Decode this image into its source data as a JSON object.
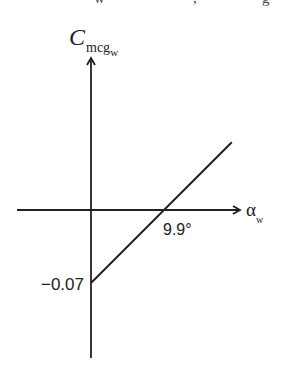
{
  "cropped_header": {
    "fragments": [
      "w",
      ",",
      "g"
    ]
  },
  "chart_data": {
    "type": "line",
    "title": "",
    "ylabel": {
      "main": "C",
      "sub": "mcg",
      "subsub": "w"
    },
    "xlabel": {
      "main": "α",
      "sub": "w"
    },
    "grid": false,
    "legend": "none",
    "series": [
      {
        "name": "C_mcg_w vs alpha_w",
        "points": [
          {
            "x": 0,
            "y": -0.07
          },
          {
            "x": 9.9,
            "y": 0.0
          },
          {
            "x": 19.1,
            "y": 0.065
          }
        ]
      }
    ],
    "annotations": [
      {
        "text": "9.9°",
        "x": 9.9,
        "y": 0,
        "role": "x-intercept"
      },
      {
        "text": "−0.07",
        "x": 0,
        "y": -0.07,
        "role": "y-intercept"
      }
    ],
    "xlim": [
      -4.7,
      9.9
    ],
    "ylim": [
      -0.145,
      0.17
    ]
  },
  "colors": {
    "line": "#222222",
    "background": "#ffffff"
  }
}
